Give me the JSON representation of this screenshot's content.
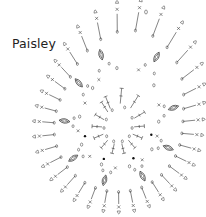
{
  "title": "Paisley",
  "diagram": {
    "type": "crochet-chart",
    "motif": "paisley",
    "center": [
      118,
      128
    ],
    "tip": [
      146,
      12
    ],
    "rings": [
      {
        "name": "foundation",
        "radius": 14,
        "stitch": "chain",
        "count": 10
      },
      {
        "name": "round-2",
        "radius": 26,
        "stitch": "treble",
        "count": 14
      },
      {
        "name": "round-3",
        "radius": 40,
        "stitch": "chain-space",
        "count": 18
      },
      {
        "name": "round-4",
        "radius": 54,
        "stitch": "puff-cluster",
        "count": 9
      },
      {
        "name": "round-5",
        "radius": 70,
        "stitch": "single-crochet-picot",
        "count": 34
      }
    ],
    "legend_symbols": [
      "chain",
      "single-crochet",
      "treble",
      "puff-cluster",
      "picot",
      "slip-stitch"
    ],
    "colors": {
      "ink": "#333333",
      "background": "#ffffff"
    }
  }
}
